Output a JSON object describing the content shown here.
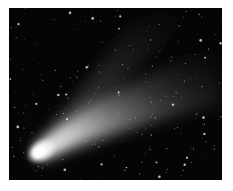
{
  "image": {
    "subject": "Comet with long dust and ion tails against a star field",
    "style": "grayscale astrophotograph",
    "colors": {
      "border": "#ffffff",
      "sky": "#050505",
      "comet_head": "#ffffff",
      "tail": "#bfbfbf",
      "stars": "#d8d8d8"
    }
  }
}
